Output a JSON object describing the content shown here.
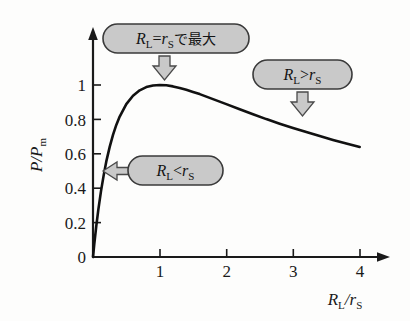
{
  "figure": {
    "background_color": "#fdfdfc",
    "ink_color": "#1a1a1a",
    "callout_fill": "#c9c9c9",
    "callout_stroke": "#3a3a3a"
  },
  "axes": {
    "y_title_num": "P",
    "y_title_slash": "/",
    "y_title_den": "P",
    "y_title_den_sub": "m",
    "x_title_num": "R",
    "x_title_num_sub": "L",
    "x_title_slash": "/",
    "x_title_den": "r",
    "x_title_den_sub": "S",
    "x_ticks": [
      "1",
      "2",
      "3",
      "4"
    ],
    "y_ticks": [
      "0",
      "0.2",
      "0.4",
      "0.6",
      "0.8",
      "1"
    ],
    "origin_label": "0"
  },
  "callouts": [
    {
      "id": "peak",
      "var1": "R",
      "var1_sub": "L",
      "relation": "=",
      "var2": "r",
      "var2_sub": "S",
      "suffix": "で最大",
      "arrow": "down-arrow-icon"
    },
    {
      "id": "greater",
      "var1": "R",
      "var1_sub": "L",
      "relation": ">",
      "var2": "r",
      "var2_sub": "S",
      "suffix": "",
      "arrow": "down-arrow-icon"
    },
    {
      "id": "less",
      "var1": "R",
      "var1_sub": "L",
      "relation": "<",
      "var2": "r",
      "var2_sub": "S",
      "suffix": "",
      "arrow": "left-arrow-icon"
    }
  ],
  "chart_data": {
    "type": "line",
    "title": "",
    "xlabel": "R_L / r_S",
    "ylabel": "P / P_m",
    "xlim": [
      0,
      4.3
    ],
    "ylim": [
      0,
      1.12
    ],
    "grid": false,
    "legend": null,
    "xticks": [
      0,
      1,
      2,
      3,
      4
    ],
    "yticks": [
      0,
      0.2,
      0.4,
      0.6,
      0.8,
      1.0
    ],
    "series": [
      {
        "name": "P/P_m = 4x/(1+x)^2",
        "x": [
          0.0,
          0.02,
          0.05,
          0.08,
          0.12,
          0.16,
          0.2,
          0.25,
          0.3,
          0.35,
          0.4,
          0.5,
          0.6,
          0.7,
          0.8,
          0.9,
          1.0,
          1.1,
          1.2,
          1.3,
          1.4,
          1.5,
          1.6,
          1.8,
          2.0,
          2.2,
          2.4,
          2.6,
          2.8,
          3.0,
          3.2,
          3.4,
          3.6,
          3.8,
          4.0
        ],
        "y": [
          0.0,
          0.077,
          0.181,
          0.274,
          0.383,
          0.476,
          0.556,
          0.64,
          0.71,
          0.768,
          0.816,
          0.889,
          0.938,
          0.969,
          0.988,
          0.997,
          1.0,
          0.998,
          0.992,
          0.983,
          0.972,
          0.96,
          0.947,
          0.918,
          0.889,
          0.859,
          0.83,
          0.802,
          0.775,
          0.75,
          0.726,
          0.703,
          0.681,
          0.66,
          0.64
        ]
      }
    ],
    "annotations": [
      {
        "text": "R_L = r_S で最大",
        "points_to": [
          1.05,
          1.0
        ]
      },
      {
        "text": "R_L > r_S",
        "points_to": [
          3.1,
          0.8
        ]
      },
      {
        "text": "R_L < r_S",
        "points_to": [
          0.15,
          0.52
        ]
      }
    ]
  }
}
